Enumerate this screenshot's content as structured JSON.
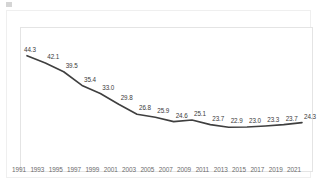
{
  "header": {
    "partial_title_visible": false,
    "title_placeholder": ""
  },
  "chart_data": {
    "type": "line",
    "title": "",
    "subtitle": "",
    "xlabel": "",
    "ylabel": "",
    "categories": [
      "1991",
      "1993",
      "1995",
      "1997",
      "1999",
      "2001",
      "2003",
      "2005",
      "2007",
      "2009",
      "2011",
      "2013",
      "2015",
      "2017",
      "2019",
      "2021"
    ],
    "values": [
      44.3,
      42.1,
      39.5,
      35.4,
      33.0,
      29.8,
      26.8,
      25.9,
      24.6,
      25.1,
      23.7,
      22.9,
      23.0,
      23.3,
      23.7,
      24.3
    ],
    "series": [
      {
        "name": "",
        "values": [
          44.3,
          42.1,
          39.5,
          35.4,
          33.0,
          29.8,
          26.8,
          25.9,
          24.6,
          25.1,
          23.7,
          22.9,
          23.0,
          23.3,
          23.7,
          24.3
        ]
      }
    ],
    "data_labels": [
      "44.3",
      "42.1",
      "39.5",
      "35.4",
      "33.0",
      "29.8",
      "26.8",
      "25.9",
      "24.6",
      "25.1",
      "23.7",
      "22.9",
      "23.0",
      "23.3",
      "23.7",
      "24.3"
    ],
    "ylim": [
      20.0,
      46.0
    ],
    "xlim": [
      "1991",
      "2021"
    ],
    "grid": false,
    "legend": "none",
    "show_markers": false,
    "line_color": "#3f3f3f",
    "label_color": "#3a3a3a",
    "axis_label_color": "#6d6d6d",
    "plot_border_color": "#e4e4e4",
    "card_border_color": "#efefef",
    "background": "#ffffff"
  }
}
